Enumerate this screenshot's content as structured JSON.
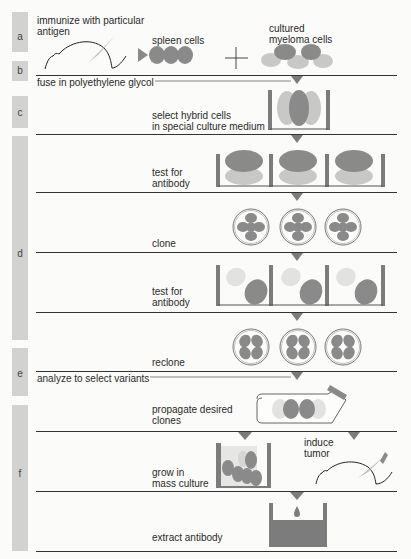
{
  "colors": {
    "dark_cell": "#8a8a8a",
    "light_cell": "#c8c8c6",
    "pale_cell": "#e2e2e0",
    "container": "#7c7c7c",
    "sidebar": "#d2d2d0",
    "line": "#333333"
  },
  "steps": [
    {
      "label": "a",
      "texts": [
        "immunize with particular antigen",
        "spleen cells",
        "cultured myeloma cells"
      ]
    },
    {
      "label": "b",
      "texts": [
        "fuse in polyethylene glycol"
      ]
    },
    {
      "label": "c",
      "texts": [
        "select hybrid cells in special culture medium"
      ]
    },
    {
      "label": "d",
      "texts": [
        "test for antibody",
        "clone",
        "test for antibody",
        "reclone"
      ]
    },
    {
      "label": "e",
      "texts": [
        "analyze to select variants",
        "propagate desired clones"
      ]
    },
    {
      "label": "f",
      "texts": [
        "grow in mass culture",
        "induce tumor",
        "extract antibody"
      ]
    }
  ],
  "text": {
    "immunize_1": "immunize with particular",
    "immunize_2": "antigen",
    "spleen": "spleen cells",
    "myeloma_1": "cultured",
    "myeloma_2": "myeloma cells",
    "fuse": "fuse in polyethylene glycol",
    "select_1": "select hybrid cells",
    "select_2": "in special culture medium",
    "test1_1": "test for",
    "test1_2": "antibody",
    "clone": "clone",
    "test2_1": "test for",
    "test2_2": "antibody",
    "reclone": "reclone",
    "analyze": "analyze to select variants",
    "propagate_1": "propagate desired",
    "propagate_2": "clones",
    "grow_1": "grow in",
    "grow_2": "mass culture",
    "induce_1": "induce",
    "induce_2": "tumor",
    "extract": "extract antibody",
    "plus": "+"
  }
}
